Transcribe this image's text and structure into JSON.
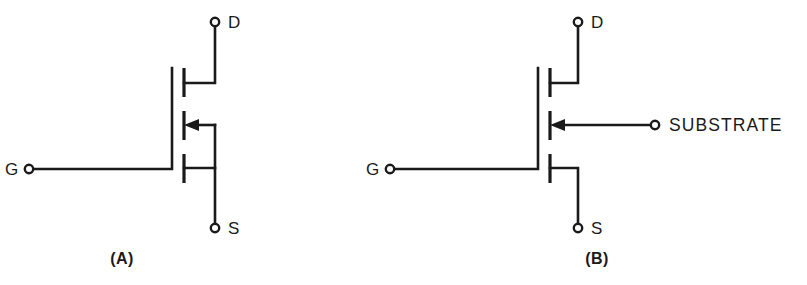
{
  "figure": {
    "type": "schematic-diagram",
    "background_color": "#ffffff",
    "line_color": "#1a1a1a"
  },
  "panels": [
    {
      "id": "A",
      "caption": "(A)",
      "description": "MOSFET symbol with substrate internally connected to source",
      "terminals": [
        {
          "name": "drain",
          "label": "D"
        },
        {
          "name": "gate",
          "label": "G"
        },
        {
          "name": "source",
          "label": "S"
        }
      ],
      "substrate": {
        "label": "",
        "connected_to": "source",
        "arrow_direction": "left"
      }
    },
    {
      "id": "B",
      "caption": "(B)",
      "description": "MOSFET symbol with substrate brought out as a separate terminal",
      "terminals": [
        {
          "name": "drain",
          "label": "D"
        },
        {
          "name": "gate",
          "label": "G"
        },
        {
          "name": "source",
          "label": "S"
        },
        {
          "name": "substrate",
          "label": "SUBSTRATE"
        }
      ],
      "substrate": {
        "label": "SUBSTRATE",
        "connected_to": "external-terminal",
        "arrow_direction": "left"
      }
    }
  ]
}
